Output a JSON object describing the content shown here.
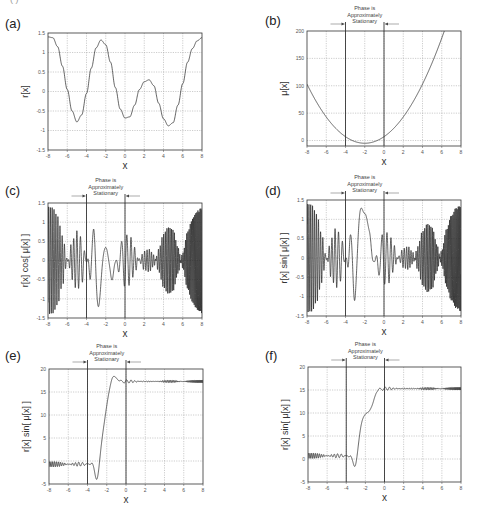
{
  "figure": {
    "top_fragment": "( )",
    "stationary_annotation": [
      "Phase is",
      "Approximately",
      "Stationary"
    ],
    "stationary_region": [
      -4,
      0
    ]
  },
  "chart_data": [
    {
      "id": "a",
      "panel_label": "(a)",
      "type": "line",
      "title": "",
      "xlabel": "x",
      "ylabel": "r[x]",
      "xlim": [
        -8,
        8
      ],
      "ylim": [
        -1.5,
        1.5
      ],
      "xticks": [
        "-8",
        "-6",
        "-4",
        "-2",
        "0",
        "2",
        "4",
        "6",
        "8"
      ],
      "yticks": [
        "1.5",
        "1",
        "0.5",
        "0",
        "-0.5",
        "-1",
        "-1.5"
      ],
      "grid": true,
      "annotation": false,
      "series": [
        {
          "name": "r[x]",
          "points": [
            [
              -8,
              1.4
            ],
            [
              -7.5,
              1.38
            ],
            [
              -7,
              1.15
            ],
            [
              -6.5,
              0.65
            ],
            [
              -6,
              0.05
            ],
            [
              -5.5,
              -0.5
            ],
            [
              -5,
              -0.78
            ],
            [
              -4.5,
              -0.6
            ],
            [
              -4,
              -0.05
            ],
            [
              -3.5,
              0.6
            ],
            [
              -3,
              1.12
            ],
            [
              -2.5,
              1.32
            ],
            [
              -2,
              1.2
            ],
            [
              -1.5,
              0.75
            ],
            [
              -1,
              0.1
            ],
            [
              -0.5,
              -0.45
            ],
            [
              0,
              -0.68
            ],
            [
              0.5,
              -0.65
            ],
            [
              1,
              -0.35
            ],
            [
              1.5,
              0.05
            ],
            [
              2,
              0.25
            ],
            [
              2.5,
              0.3
            ],
            [
              3,
              0.15
            ],
            [
              3.5,
              -0.3
            ],
            [
              4,
              -0.7
            ],
            [
              4.5,
              -0.88
            ],
            [
              5,
              -0.8
            ],
            [
              5.5,
              -0.35
            ],
            [
              6,
              0.2
            ],
            [
              6.5,
              0.75
            ],
            [
              7,
              1.1
            ],
            [
              7.5,
              1.3
            ],
            [
              8,
              1.38
            ]
          ]
        }
      ]
    },
    {
      "id": "b",
      "panel_label": "(b)",
      "type": "line",
      "title": "",
      "xlabel": "x",
      "ylabel": "μ[x]",
      "xlim": [
        -8,
        8
      ],
      "ylim": [
        -10,
        200
      ],
      "xticks": [
        "-8",
        "-6",
        "-4",
        "-2",
        "0",
        "2",
        "4",
        "6",
        "8"
      ],
      "yticks": [
        "200",
        "150",
        "100",
        "50",
        "0"
      ],
      "ytick_values": [
        200,
        150,
        100,
        50,
        0
      ],
      "grid": true,
      "annotation": true,
      "series": [
        {
          "name": "μ[x]",
          "points": [
            [
              -8,
              78
            ],
            [
              -7,
              56
            ],
            [
              -6,
              37
            ],
            [
              -5,
              21
            ],
            [
              -4,
              9
            ],
            [
              -3,
              1
            ],
            [
              -2,
              -5
            ],
            [
              -1,
              -3
            ],
            [
              0,
              4
            ],
            [
              1,
              15
            ],
            [
              2,
              30
            ],
            [
              3,
              50
            ],
            [
              4,
              78
            ],
            [
              5,
              110
            ],
            [
              6,
              148
            ],
            [
              7,
              188
            ],
            [
              7.3,
              200
            ]
          ]
        }
      ]
    },
    {
      "id": "c",
      "panel_label": "(c)",
      "type": "line",
      "title": "",
      "xlabel": "x",
      "ylabel": "r[x] cos[ μ[x] ]",
      "xlim": [
        -8,
        8
      ],
      "ylim": [
        -1.5,
        1.5
      ],
      "xticks": [
        "-8",
        "-6",
        "-4",
        "-2",
        "0",
        "2",
        "4",
        "6",
        "8"
      ],
      "yticks": [
        "1.5",
        "1",
        "0.5",
        "0",
        "-0.5",
        "-1",
        "-1.5"
      ],
      "grid": true,
      "annotation": true,
      "series": [
        {
          "name": "r[x] cos[μ[x]]",
          "generator": "cos"
        }
      ]
    },
    {
      "id": "d",
      "panel_label": "(d)",
      "type": "line",
      "title": "",
      "xlabel": "x",
      "ylabel": "r[x] sin[ μ[x] ]",
      "xlim": [
        -8,
        8
      ],
      "ylim": [
        -1.5,
        1.5
      ],
      "xticks": [
        "-8",
        "-6",
        "-4",
        "-2",
        "0",
        "2",
        "4",
        "6",
        "8"
      ],
      "yticks": [
        "1.5",
        "1",
        "0.5",
        "0",
        "-0.5",
        "-1",
        "-1.5"
      ],
      "grid": true,
      "annotation": true,
      "series": [
        {
          "name": "r[x] sin[μ[x]]",
          "generator": "sin"
        }
      ]
    },
    {
      "id": "e",
      "panel_label": "(e)",
      "type": "line",
      "title": "",
      "xlabel": "x",
      "ylabel": "r[x] sin[ μ[x] ]",
      "xlim": [
        -8,
        8
      ],
      "ylim": [
        -5,
        20
      ],
      "xticks": [
        "-8",
        "-6",
        "-4",
        "-2",
        "0",
        "2",
        "4",
        "6",
        "8"
      ],
      "yticks": [
        "20",
        "15",
        "10",
        "5",
        "0",
        "-5"
      ],
      "grid": true,
      "annotation": true,
      "series": [
        {
          "name": "cumulative integral",
          "generator": "stepE",
          "start_level": -0.7,
          "end_level": 17.3,
          "dip_x": -3.0,
          "dip_y": -4.5,
          "peak_x": -1.3,
          "peak_y": 19.2
        }
      ]
    },
    {
      "id": "f",
      "panel_label": "(f)",
      "type": "line",
      "title": "",
      "xlabel": "x",
      "ylabel": "r[x] sin[ μ[x] ]",
      "xlim": [
        -8,
        8
      ],
      "ylim": [
        -5,
        20
      ],
      "xticks": [
        "-8",
        "-6",
        "-4",
        "-2",
        "0",
        "2",
        "4",
        "6",
        "8"
      ],
      "yticks": [
        "20",
        "15",
        "10",
        "5",
        "0",
        "-5"
      ],
      "grid": true,
      "annotation": true,
      "series": [
        {
          "name": "cumulative integral",
          "generator": "stepF",
          "start_level": 0.7,
          "end_level": 15.3,
          "dip_x": -3.1,
          "dip_y": -1.6,
          "shoulder_y": 9.2
        }
      ]
    }
  ],
  "layout": {
    "panels": {
      "a": {
        "plot": [
          48,
          33,
          202,
          150
        ],
        "label_pos": [
          5,
          16
        ]
      },
      "b": {
        "plot": [
          307,
          31,
          461,
          146
        ],
        "label_pos": [
          265,
          13
        ]
      },
      "c": {
        "plot": [
          48,
          203,
          202,
          318
        ],
        "label_pos": [
          5,
          183
        ]
      },
      "d": {
        "plot": [
          307,
          200,
          461,
          316
        ],
        "label_pos": [
          265,
          183
        ]
      },
      "e": {
        "plot": [
          49,
          369,
          203,
          484
        ],
        "label_pos": [
          5,
          348
        ]
      },
      "f": {
        "plot": [
          308,
          367,
          461,
          482
        ],
        "label_pos": [
          265,
          348
        ]
      }
    }
  }
}
